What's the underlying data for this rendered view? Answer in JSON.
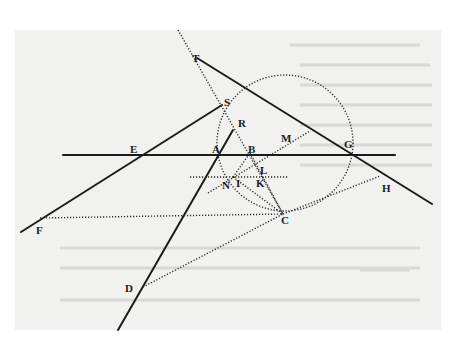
{
  "figure": {
    "labels": [
      {
        "id": "T",
        "text": "T",
        "x": 192,
        "y": 62
      },
      {
        "id": "S",
        "text": "S",
        "x": 224,
        "y": 106
      },
      {
        "id": "R",
        "text": "R",
        "x": 238,
        "y": 127
      },
      {
        "id": "M",
        "text": "M",
        "x": 281,
        "y": 142
      },
      {
        "id": "E",
        "text": "E",
        "x": 130,
        "y": 153
      },
      {
        "id": "A",
        "text": "A",
        "x": 212,
        "y": 153
      },
      {
        "id": "B",
        "text": "B",
        "x": 248,
        "y": 153
      },
      {
        "id": "G",
        "text": "G",
        "x": 344,
        "y": 148
      },
      {
        "id": "L",
        "text": "L",
        "x": 260,
        "y": 174
      },
      {
        "id": "N",
        "text": "N",
        "x": 222,
        "y": 189
      },
      {
        "id": "I",
        "text": "I",
        "x": 236,
        "y": 187
      },
      {
        "id": "K",
        "text": "K",
        "x": 256,
        "y": 187
      },
      {
        "id": "H",
        "text": "H",
        "x": 382,
        "y": 192
      },
      {
        "id": "C",
        "text": "C",
        "x": 281,
        "y": 224
      },
      {
        "id": "F",
        "text": "F",
        "x": 36,
        "y": 234
      },
      {
        "id": "D",
        "text": "D",
        "x": 125,
        "y": 292
      }
    ],
    "circle": {
      "cx": 285,
      "cy": 143,
      "r": 68
    },
    "solid_lines": [
      {
        "name": "horizontal-axis-EG",
        "x1": 63,
        "y1": 155,
        "x2": 395,
        "y2": 155
      },
      {
        "name": "line-T-through-G",
        "x1": 197,
        "y1": 58,
        "x2": 432,
        "y2": 204
      },
      {
        "name": "line-F-through-E-to-S",
        "x1": 21,
        "y1": 232,
        "x2": 222,
        "y2": 105
      },
      {
        "name": "line-D-through-A-to-R",
        "x1": 118,
        "y1": 330,
        "x2": 233,
        "y2": 130
      }
    ],
    "dotted_lines": [
      {
        "name": "dotted-T-through-S-to-C",
        "x1": 178,
        "y1": 30,
        "x2": 283,
        "y2": 214
      },
      {
        "name": "dotted-F-to-C",
        "x1": 40,
        "y1": 218,
        "x2": 283,
        "y2": 214
      },
      {
        "name": "dotted-D-to-C",
        "x1": 143,
        "y1": 287,
        "x2": 283,
        "y2": 214
      },
      {
        "name": "dotted-C-to-H",
        "x1": 283,
        "y1": 214,
        "x2": 380,
        "y2": 176
      },
      {
        "name": "dotted-horizontal-NK",
        "x1": 190,
        "y1": 177,
        "x2": 288,
        "y2": 177
      },
      {
        "name": "dotted-N-to-B",
        "x1": 233,
        "y1": 177,
        "x2": 250,
        "y2": 153
      },
      {
        "name": "dotted-N-to-M",
        "x1": 208,
        "y1": 193,
        "x2": 310,
        "y2": 131
      },
      {
        "name": "dotted-N-to-C",
        "x1": 233,
        "y1": 177,
        "x2": 283,
        "y2": 214
      },
      {
        "name": "dotted-B-to-K",
        "x1": 250,
        "y1": 153,
        "x2": 283,
        "y2": 214
      }
    ],
    "colors": {
      "ink": "#1b1b1b",
      "paper": "#f1f1f0",
      "background": "#ffffff"
    }
  }
}
